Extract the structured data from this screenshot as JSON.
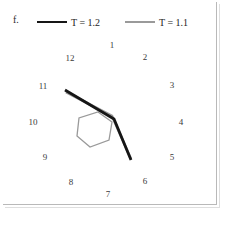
{
  "figure": {
    "panel_label": "f.",
    "background_color": "#ffffff",
    "frame_color": "#b9b9b9"
  },
  "legend": {
    "position": "top",
    "entries": [
      {
        "label_prefix": "T",
        "label_eq": " = ",
        "label_value": "1.2",
        "full_label": "T = 1.2",
        "color": "#161616",
        "style": "solid",
        "width_px": 2.4
      },
      {
        "label_prefix": "T",
        "label_eq": " = ",
        "label_value": "1.1",
        "full_label": "T = 1.1",
        "color": "#9a9a9a",
        "style": "solid",
        "width_px": 2.4
      }
    ]
  },
  "chart_data": {
    "type": "line",
    "title": "",
    "subtitle": "",
    "xlabel": "",
    "ylabel": "",
    "grid": false,
    "legend_position": "top",
    "annotations": [
      {
        "text": "f.",
        "x": 13,
        "y": 20,
        "role": "panel-label"
      }
    ],
    "node_labels": {
      "description": "Ring of numbered site labels arranged around the centre",
      "color": "#3a3a3a",
      "font_size": 9,
      "items": [
        {
          "label": "1",
          "x": 112,
          "y": 45
        },
        {
          "label": "2",
          "x": 145,
          "y": 57
        },
        {
          "label": "3",
          "x": 172,
          "y": 85
        },
        {
          "label": "4",
          "x": 181,
          "y": 122
        },
        {
          "label": "5",
          "x": 172,
          "y": 157
        },
        {
          "label": "6",
          "x": 145,
          "y": 181
        },
        {
          "label": "7",
          "x": 108,
          "y": 194
        },
        {
          "label": "8",
          "x": 71,
          "y": 182
        },
        {
          "label": "9",
          "x": 45,
          "y": 157
        },
        {
          "label": "10",
          "x": 33,
          "y": 122
        },
        {
          "label": "11",
          "x": 43,
          "y": 86
        },
        {
          "label": "12",
          "x": 70,
          "y": 58
        }
      ]
    },
    "series": [
      {
        "name": "hexagon-outline",
        "role": "reference-polygon",
        "color": "#9a9a9a",
        "width_px": 1.3,
        "closed": true,
        "points": [
          [
            98,
            112
          ],
          [
            112,
            122
          ],
          [
            109,
            140
          ],
          [
            90,
            147
          ],
          [
            77,
            136
          ],
          [
            79,
            118
          ]
        ]
      },
      {
        "name": "T = 1.1",
        "role": "trajectory",
        "color": "#9a9a9a",
        "width_px": 2.6,
        "closed": false,
        "points": [
          [
            66,
            92
          ],
          [
            112,
            116
          ],
          [
            131,
            159
          ]
        ]
      },
      {
        "name": "T = 1.2",
        "role": "trajectory",
        "color": "#161616",
        "width_px": 2.8,
        "closed": false,
        "points": [
          [
            65,
            90
          ],
          [
            114,
            119
          ],
          [
            131,
            160
          ]
        ]
      }
    ]
  }
}
